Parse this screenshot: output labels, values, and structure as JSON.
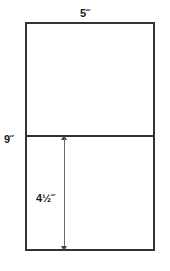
{
  "diagram": {
    "shape": "rectangle",
    "outline_color": "#333333",
    "fill_color": "#ffffff",
    "dimension_line_color": "#6b6b6b",
    "labels": {
      "top_width": "5˝",
      "left_height": "9˝",
      "inner_height": "4½˝"
    },
    "measurements": [
      {
        "name": "width",
        "value": "5",
        "unit": "inches",
        "position": "top"
      },
      {
        "name": "total-height",
        "value": "9",
        "unit": "inches",
        "position": "left"
      },
      {
        "name": "lower-section-height",
        "value": "4 1/2",
        "unit": "inches",
        "position": "inner-lower"
      }
    ]
  }
}
